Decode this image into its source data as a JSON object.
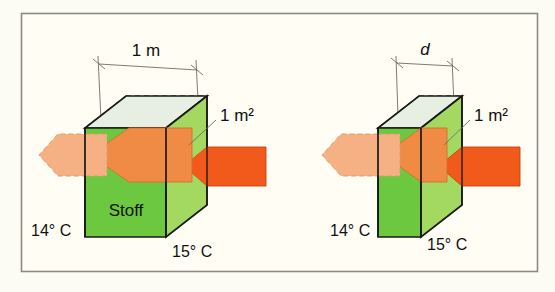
{
  "figure": {
    "background_color": "#fdfcf4",
    "frame_color": "#8a8a80",
    "panels": [
      {
        "id": "left",
        "width_label": "1 m",
        "area_label": "1 m²",
        "material_label": "Stoff",
        "temp_cold_label": "14° C",
        "temp_hot_label": "15° C"
      },
      {
        "id": "right",
        "width_label": "d",
        "width_label_italic": true,
        "area_label": "1 m²",
        "material_label": "",
        "temp_cold_label": "14° C",
        "temp_hot_label": "15° C"
      }
    ],
    "colors": {
      "cube_front": "#6cc83e",
      "cube_right": "#a3d861",
      "cube_top": "#e6efe1",
      "cube_top_right": "#d3e5c6",
      "edge": "#1a1a1a",
      "arrow_light": "#f5b183",
      "arrow_mid": "#f08b45",
      "arrow_dark": "#f25a1c",
      "dimension_line": "#6e6e66",
      "text": "#111111"
    }
  }
}
